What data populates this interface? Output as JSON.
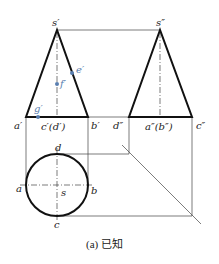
{
  "figure": {
    "caption": "(a) 已知",
    "accent_color": "#5a7fb0",
    "front_view": {
      "apex_label": "s′",
      "base_left_label": "a′",
      "base_mid_label": "c′(d′)",
      "base_right_label": "b′",
      "points": [
        {
          "label": "e′",
          "on": "right generatrix"
        },
        {
          "label": "f′",
          "on": "axis"
        },
        {
          "label": "g′",
          "on": "base"
        }
      ]
    },
    "side_view": {
      "apex_label": "s″",
      "base_left_label": "d″",
      "base_mid_label": "a″(b″)",
      "base_right_label": "c″"
    },
    "top_view": {
      "center_label": "s",
      "left_label": "a",
      "right_label": "b",
      "top_label": "d",
      "bottom_label": "c"
    }
  }
}
